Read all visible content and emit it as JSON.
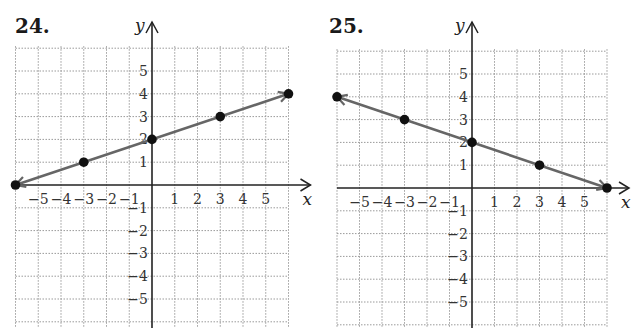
{
  "chart_data": [
    {
      "type": "line",
      "title": "24.",
      "xlabel": "x",
      "ylabel": "y",
      "xlim": [
        -6,
        6
      ],
      "ylim": [
        -6,
        6
      ],
      "grid": true,
      "x_ticks": [
        -5,
        -4,
        -3,
        -2,
        -1,
        1,
        2,
        3,
        4,
        5
      ],
      "y_ticks": [
        5,
        4,
        3,
        2,
        1,
        -1,
        -2,
        -3,
        -4,
        -5
      ],
      "points": [
        [
          -6,
          0
        ],
        [
          -3,
          1
        ],
        [
          0,
          2
        ],
        [
          3,
          3
        ],
        [
          6,
          4
        ]
      ],
      "line": {
        "from": [
          -6,
          0
        ],
        "to": [
          6,
          4
        ],
        "arrow_ends": "both",
        "color": "#666666"
      },
      "equation": "y = (1/3)x + 2"
    },
    {
      "type": "line",
      "title": "25.",
      "xlabel": "x",
      "ylabel": "y",
      "xlim": [
        -6,
        6
      ],
      "ylim": [
        -6,
        6
      ],
      "grid": true,
      "x_ticks": [
        -5,
        -4,
        -3,
        -2,
        -1,
        1,
        2,
        3,
        4,
        5
      ],
      "y_ticks": [
        5,
        4,
        3,
        2,
        1,
        -1,
        -2,
        -3,
        -4,
        -5
      ],
      "points": [
        [
          -6,
          4
        ],
        [
          -3,
          3
        ],
        [
          0,
          2
        ],
        [
          3,
          1
        ],
        [
          6,
          0
        ]
      ],
      "line": {
        "from": [
          -6,
          4
        ],
        "to": [
          6,
          0
        ],
        "arrow_ends": "both",
        "color": "#666666"
      },
      "equation": "y = -(1/3)x + 2"
    }
  ],
  "panels": [
    {
      "label": "24.",
      "x_axis_label": "x",
      "y_axis_label": "y"
    },
    {
      "label": "25.",
      "x_axis_label": "x",
      "y_axis_label": "y"
    }
  ],
  "colors": {
    "line": "#666666",
    "point": "#111111",
    "grid": "#9a9a9a",
    "axis": "#222222"
  }
}
